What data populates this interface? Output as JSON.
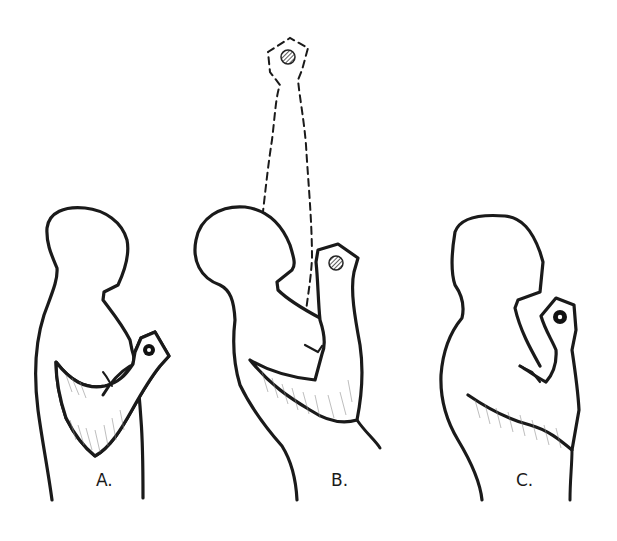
{
  "illustration": {
    "subject": "bicep curl progression",
    "panels": [
      {
        "id": "A",
        "label": "A.",
        "dumbbell": "solid-black"
      },
      {
        "id": "B",
        "label": "B.",
        "dumbbell": "hatched-gray",
        "ghost_arm_dashed": true
      },
      {
        "id": "C",
        "label": "C.",
        "dumbbell": "solid-black"
      }
    ]
  },
  "colors": {
    "ink": "#1a1a1a",
    "background": "#ffffff",
    "shading": "#8a8a8a",
    "hatched_dumbbell": "#555555"
  }
}
